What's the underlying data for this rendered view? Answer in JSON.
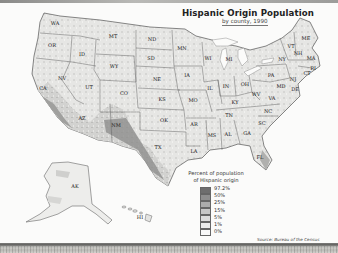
{
  "title": "Hispanic Origin Population",
  "subtitle": "by county, 1990",
  "legend": {
    "title": "Percent of population of Hispanic origin",
    "items": [
      {
        "label": "97.2%",
        "color": "#6e6e6e"
      },
      {
        "label": "50%",
        "color": "#8e8e8e"
      },
      {
        "label": "25%",
        "color": "#ababab"
      },
      {
        "label": "15%",
        "color": "#c6c6c6"
      },
      {
        "label": "5%",
        "color": "#dcdcdc"
      },
      {
        "label": "1%",
        "color": "#ececec"
      },
      {
        "label": "0%",
        "color": "#f8f8f8"
      }
    ]
  },
  "source": "Source:  Bureau of the Census",
  "states": [
    {
      "abbr": "WA",
      "x": 55,
      "y": 23
    },
    {
      "abbr": "OR",
      "x": 52,
      "y": 45
    },
    {
      "abbr": "ID",
      "x": 82,
      "y": 54
    },
    {
      "abbr": "MT",
      "x": 113,
      "y": 36
    },
    {
      "abbr": "WY",
      "x": 114,
      "y": 66
    },
    {
      "abbr": "NV",
      "x": 62,
      "y": 78
    },
    {
      "abbr": "UT",
      "x": 89,
      "y": 87
    },
    {
      "abbr": "CA",
      "x": 43,
      "y": 88
    },
    {
      "abbr": "CO",
      "x": 124,
      "y": 93
    },
    {
      "abbr": "AZ",
      "x": 82,
      "y": 118
    },
    {
      "abbr": "NM",
      "x": 116,
      "y": 125
    },
    {
      "abbr": "ND",
      "x": 152,
      "y": 39
    },
    {
      "abbr": "SD",
      "x": 151,
      "y": 58
    },
    {
      "abbr": "NE",
      "x": 157,
      "y": 79
    },
    {
      "abbr": "KS",
      "x": 162,
      "y": 99
    },
    {
      "abbr": "OK",
      "x": 164,
      "y": 120
    },
    {
      "abbr": "TX",
      "x": 158,
      "y": 147
    },
    {
      "abbr": "MN",
      "x": 182,
      "y": 48
    },
    {
      "abbr": "IA",
      "x": 187,
      "y": 75
    },
    {
      "abbr": "MO",
      "x": 193,
      "y": 100
    },
    {
      "abbr": "AR",
      "x": 194,
      "y": 124
    },
    {
      "abbr": "LA",
      "x": 194,
      "y": 151
    },
    {
      "abbr": "WI",
      "x": 208,
      "y": 58
    },
    {
      "abbr": "IL",
      "x": 210,
      "y": 88
    },
    {
      "abbr": "MS",
      "x": 212,
      "y": 135
    },
    {
      "abbr": "MI",
      "x": 229,
      "y": 59
    },
    {
      "abbr": "IN",
      "x": 226,
      "y": 86
    },
    {
      "abbr": "OH",
      "x": 245,
      "y": 84
    },
    {
      "abbr": "KY",
      "x": 235,
      "y": 102
    },
    {
      "abbr": "TN",
      "x": 229,
      "y": 115
    },
    {
      "abbr": "AL",
      "x": 228,
      "y": 134
    },
    {
      "abbr": "GA",
      "x": 247,
      "y": 133
    },
    {
      "abbr": "FL",
      "x": 260,
      "y": 157
    },
    {
      "abbr": "SC",
      "x": 262,
      "y": 123
    },
    {
      "abbr": "NC",
      "x": 268,
      "y": 111
    },
    {
      "abbr": "VA",
      "x": 272,
      "y": 98
    },
    {
      "abbr": "WV",
      "x": 256,
      "y": 94
    },
    {
      "abbr": "PA",
      "x": 271,
      "y": 75
    },
    {
      "abbr": "NY",
      "x": 282,
      "y": 59
    },
    {
      "abbr": "MD",
      "x": 281,
      "y": 86
    },
    {
      "abbr": "DE",
      "x": 295,
      "y": 89
    },
    {
      "abbr": "NJ",
      "x": 293,
      "y": 79
    },
    {
      "abbr": "CT",
      "x": 307,
      "y": 73
    },
    {
      "abbr": "RI",
      "x": 313,
      "y": 68
    },
    {
      "abbr": "MA",
      "x": 311,
      "y": 58
    },
    {
      "abbr": "NH",
      "x": 298,
      "y": 53
    },
    {
      "abbr": "VT",
      "x": 291,
      "y": 46
    },
    {
      "abbr": "ME",
      "x": 306,
      "y": 38
    },
    {
      "abbr": "AK",
      "x": 75,
      "y": 186
    },
    {
      "abbr": "HI",
      "x": 140,
      "y": 217
    }
  ]
}
